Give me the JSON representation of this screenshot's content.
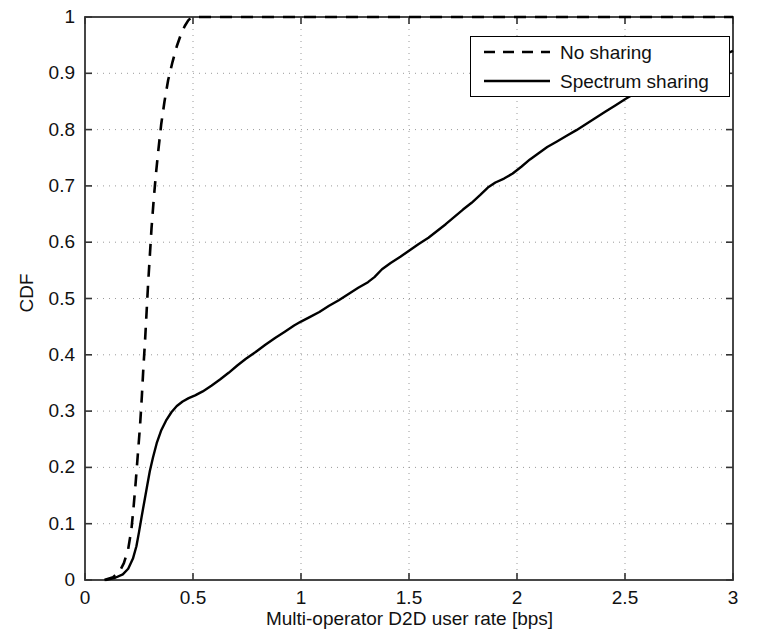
{
  "chart_data": {
    "type": "line",
    "title": "",
    "xlabel": "Multi-operator D2D user rate [bps]",
    "ylabel": "CDF",
    "xlim": [
      0,
      3
    ],
    "ylim": [
      0,
      1
    ],
    "xticks": [
      "0",
      "0.5",
      "1",
      "1.5",
      "2",
      "2.5",
      "3"
    ],
    "xtick_values": [
      0,
      0.5,
      1,
      1.5,
      2,
      2.5,
      3
    ],
    "yticks": [
      "0",
      "0.1",
      "0.2",
      "0.3",
      "0.4",
      "0.5",
      "0.6",
      "0.7",
      "0.8",
      "0.9",
      "1"
    ],
    "ytick_values": [
      0,
      0.1,
      0.2,
      0.3,
      0.4,
      0.5,
      0.6,
      0.7,
      0.8,
      0.9,
      1
    ],
    "grid": true,
    "grid_style": "dotted",
    "legend_position": "top-right",
    "series": [
      {
        "name": "No sharing",
        "style": "dashed",
        "color": "#000000",
        "points": [
          [
            0.09,
            0.0
          ],
          [
            0.13,
            0.005
          ],
          [
            0.16,
            0.015
          ],
          [
            0.18,
            0.03
          ],
          [
            0.2,
            0.055
          ],
          [
            0.215,
            0.09
          ],
          [
            0.225,
            0.13
          ],
          [
            0.235,
            0.175
          ],
          [
            0.245,
            0.225
          ],
          [
            0.255,
            0.275
          ],
          [
            0.263,
            0.325
          ],
          [
            0.27,
            0.375
          ],
          [
            0.278,
            0.425
          ],
          [
            0.285,
            0.475
          ],
          [
            0.292,
            0.525
          ],
          [
            0.3,
            0.575
          ],
          [
            0.308,
            0.625
          ],
          [
            0.318,
            0.675
          ],
          [
            0.328,
            0.72
          ],
          [
            0.34,
            0.765
          ],
          [
            0.353,
            0.81
          ],
          [
            0.368,
            0.85
          ],
          [
            0.385,
            0.888
          ],
          [
            0.405,
            0.92
          ],
          [
            0.425,
            0.948
          ],
          [
            0.445,
            0.97
          ],
          [
            0.462,
            0.984
          ],
          [
            0.478,
            0.994
          ],
          [
            0.492,
            0.999
          ],
          [
            0.52,
            1.0
          ],
          [
            0.64,
            1.0
          ],
          [
            1.0,
            1.0
          ],
          [
            1.5,
            1.0
          ],
          [
            2.0,
            1.0
          ],
          [
            2.5,
            1.0
          ],
          [
            3.0,
            1.0
          ]
        ]
      },
      {
        "name": "Spectrum sharing",
        "style": "solid",
        "color": "#000000",
        "points": [
          [
            0.095,
            0.0
          ],
          [
            0.14,
            0.004
          ],
          [
            0.175,
            0.01
          ],
          [
            0.2,
            0.02
          ],
          [
            0.222,
            0.038
          ],
          [
            0.238,
            0.06
          ],
          [
            0.25,
            0.085
          ],
          [
            0.262,
            0.112
          ],
          [
            0.275,
            0.14
          ],
          [
            0.288,
            0.168
          ],
          [
            0.3,
            0.193
          ],
          [
            0.315,
            0.218
          ],
          [
            0.332,
            0.243
          ],
          [
            0.352,
            0.265
          ],
          [
            0.375,
            0.283
          ],
          [
            0.4,
            0.298
          ],
          [
            0.425,
            0.309
          ],
          [
            0.452,
            0.317
          ],
          [
            0.48,
            0.323
          ],
          [
            0.51,
            0.328
          ],
          [
            0.545,
            0.335
          ],
          [
            0.585,
            0.345
          ],
          [
            0.625,
            0.356
          ],
          [
            0.665,
            0.368
          ],
          [
            0.705,
            0.381
          ],
          [
            0.745,
            0.393
          ],
          [
            0.79,
            0.405
          ],
          [
            0.835,
            0.418
          ],
          [
            0.88,
            0.43
          ],
          [
            0.925,
            0.441
          ],
          [
            0.968,
            0.452
          ],
          [
            1.0,
            0.459
          ],
          [
            1.04,
            0.467
          ],
          [
            1.085,
            0.476
          ],
          [
            1.13,
            0.487
          ],
          [
            1.175,
            0.497
          ],
          [
            1.22,
            0.508
          ],
          [
            1.265,
            0.519
          ],
          [
            1.31,
            0.529
          ],
          [
            1.34,
            0.538
          ],
          [
            1.375,
            0.552
          ],
          [
            1.415,
            0.563
          ],
          [
            1.46,
            0.574
          ],
          [
            1.5,
            0.585
          ],
          [
            1.545,
            0.597
          ],
          [
            1.59,
            0.608
          ],
          [
            1.63,
            0.62
          ],
          [
            1.67,
            0.632
          ],
          [
            1.71,
            0.645
          ],
          [
            1.75,
            0.658
          ],
          [
            1.79,
            0.67
          ],
          [
            1.83,
            0.684
          ],
          [
            1.865,
            0.697
          ],
          [
            1.9,
            0.706
          ],
          [
            1.94,
            0.713
          ],
          [
            1.98,
            0.722
          ],
          [
            2.02,
            0.734
          ],
          [
            2.06,
            0.747
          ],
          [
            2.1,
            0.758
          ],
          [
            2.14,
            0.769
          ],
          [
            2.185,
            0.779
          ],
          [
            2.23,
            0.789
          ],
          [
            2.275,
            0.799
          ],
          [
            2.32,
            0.81
          ],
          [
            2.365,
            0.821
          ],
          [
            2.41,
            0.832
          ],
          [
            2.455,
            0.843
          ],
          [
            2.5,
            0.854
          ],
          [
            2.545,
            0.864
          ],
          [
            2.59,
            0.874
          ],
          [
            2.635,
            0.884
          ],
          [
            2.68,
            0.893
          ],
          [
            2.725,
            0.899
          ],
          [
            2.77,
            0.905
          ],
          [
            2.815,
            0.911
          ],
          [
            2.86,
            0.918
          ],
          [
            2.9,
            0.924
          ],
          [
            2.94,
            0.93
          ],
          [
            2.97,
            0.935
          ],
          [
            3.0,
            0.94
          ]
        ]
      }
    ]
  },
  "legend": {
    "entries": [
      {
        "label": "No sharing",
        "style": "dashed"
      },
      {
        "label": "Spectrum sharing",
        "style": "solid"
      }
    ]
  },
  "axes": {
    "xlabel": "Multi-operator D2D user rate [bps]",
    "ylabel": "CDF"
  },
  "colors": {
    "line": "#000000",
    "axis": "#333333",
    "grid": "#9a9a9a",
    "background": "#ffffff"
  }
}
